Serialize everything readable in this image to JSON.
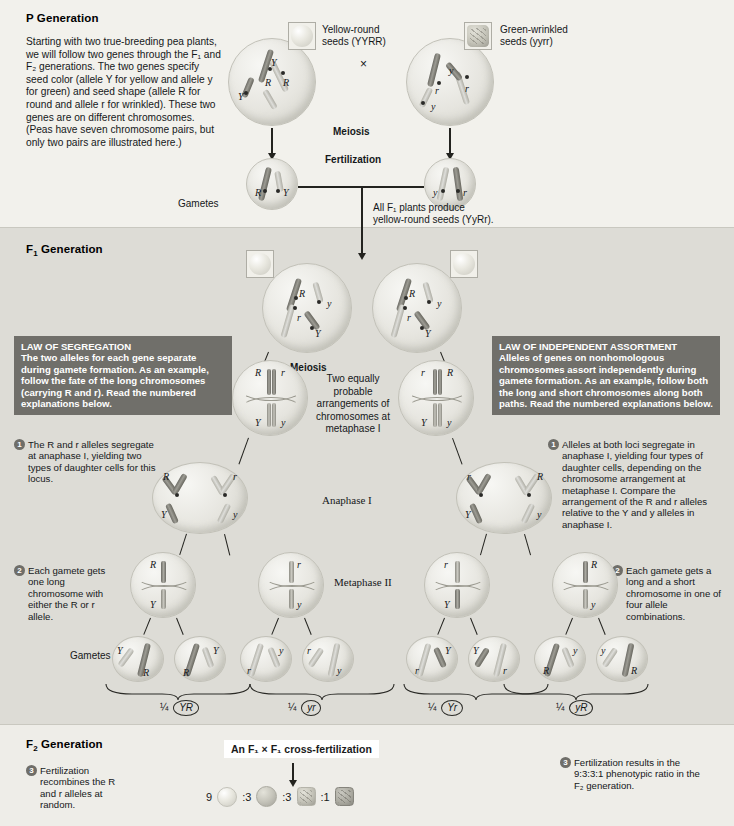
{
  "generations": {
    "p": {
      "header": "P Generation",
      "header_main": "P",
      "header_rest": " Generation",
      "paragraph": "Starting with two true-breeding pea plants, we will follow two genes through the F₁ and F₂ generations. The two genes specify seed color (allele Y for yellow and allele y for green) and seed shape (allele R for round and allele r for wrinkled). These two genes are on different chromosomes. (Peas have seven chromosome pairs, but only two pairs are illustrated here.)",
      "parent_left_label_line1": "Yellow-round",
      "parent_left_label_line2": "seeds (YYRR)",
      "parent_right_label_line1": "Green-wrinkled",
      "parent_right_label_line2": "seeds (yyrr)",
      "cross_symbol": "×",
      "meiosis_label": "Meiosis",
      "fertilization_label": "Fertilization",
      "gametes_label": "Gametes",
      "gamete_left_alleles": [
        "R",
        "Y"
      ],
      "gamete_right_alleles": [
        "y",
        "r"
      ],
      "parent_left_alleles": [
        "Y",
        "R",
        "R",
        "Y"
      ],
      "parent_right_alleles": [
        "y",
        "r",
        "r",
        "y"
      ]
    },
    "f1": {
      "header_main": "F",
      "header_sub": "1",
      "header_rest": " Generation",
      "note_line1": "All F₁ plants produce",
      "note_line2": "yellow-round seeds (YyRr).",
      "meiosis_label": "Meiosis",
      "cell_alleles": [
        "R",
        "y",
        "r",
        "Y"
      ],
      "arrangements_note": "Two equally probable arrangements of chromosomes at metaphase I",
      "anaphase_label": "Anaphase I",
      "metaphase2_label": "Metaphase II",
      "gametes_label": "Gametes",
      "metaphase1_left_alleles": [
        "R",
        "r",
        "Y",
        "y"
      ],
      "metaphase1_right_alleles": [
        "r",
        "R",
        "Y",
        "y"
      ],
      "metaphase2_alleles": [
        [
          "R",
          "Y"
        ],
        [
          "r",
          "y"
        ],
        [
          "r",
          "Y"
        ],
        [
          "R",
          "y"
        ]
      ],
      "gamete_labels": [
        "¼",
        "¼",
        "¼",
        "¼"
      ],
      "gamete_genotypes": [
        "YR",
        "yr",
        "Yr",
        "yR"
      ]
    },
    "f2": {
      "header_main": "F",
      "header_sub": "2",
      "header_rest": " Generation",
      "cross_label": "An F₁ × F₁ cross-fertilization",
      "ratio": [
        "9",
        ":3",
        ":3",
        ":1"
      ],
      "ratio_text": "9 :3 :3 :1"
    }
  },
  "laws": {
    "segregation": {
      "title": "LAW OF SEGREGATION",
      "body": "The two alleles for each gene separate during gamete formation. As an example, follow the fate of the long chromosomes (carrying R and r). Read the numbered explanations below."
    },
    "independent_assortment": {
      "title": "LAW OF INDEPENDENT ASSORTMENT",
      "body": "Alleles of genes on nonhomologous chromosomes assort independently during gamete formation. As an example, follow both the long and short chromosomes along both paths. Read the numbered explanations below."
    }
  },
  "callouts": {
    "left": [
      {
        "num": "1",
        "text": "The R and r alleles segregate at anaphase I, yielding two types of daughter cells for this locus."
      },
      {
        "num": "2",
        "text": "Each gamete gets one long chromosome with either the R or r allele."
      },
      {
        "num": "3",
        "text": "Fertilization recombines the R and r alleles at random."
      }
    ],
    "right": [
      {
        "num": "1",
        "text": "Alleles at both loci segregate in anaphase I, yielding four types of daughter cells, depending on the chromosome arrangement at metaphase I. Compare the arrangement of the R and r alleles relative to the Y and y alleles in anaphase I."
      },
      {
        "num": "2",
        "text": "Each gamete gets a long and a short chromosome in one of four allele combinations."
      },
      {
        "num": "3",
        "text": "Fertilization results in the 9:3:3:1 phenotypic ratio in the F₂ generation."
      }
    ]
  },
  "colors": {
    "band_p": "#f2f1ec",
    "band_f1": "#dddcd6",
    "band_f2": "#eeede8",
    "law_banner": "#706f6a",
    "callout_badge": "#6f6e69",
    "ink": "#15181a"
  }
}
